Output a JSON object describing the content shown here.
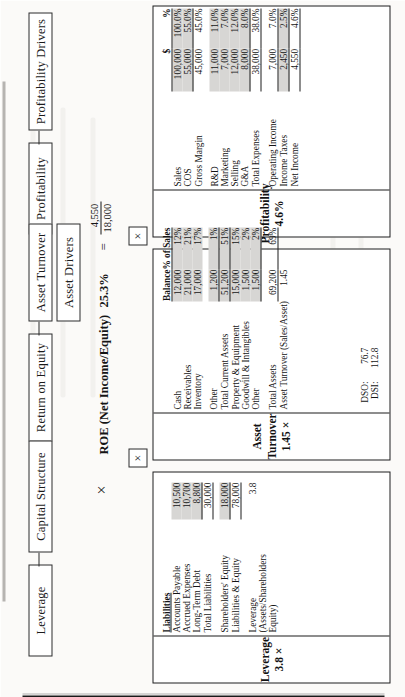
{
  "diagram": {
    "branches": [
      {
        "id": "profitability",
        "parent_label": "Profitability",
        "child_label": "Profitability Drivers"
      },
      {
        "id": "asset-turnover",
        "parent_label": "Return on Equity",
        "middle_label": "Asset Turnover",
        "child_label": "Asset Drivers"
      },
      {
        "id": "leverage",
        "parent_label": "Leverage",
        "child_label": "Capital Structure"
      }
    ],
    "operator": "×",
    "box_operator": "×"
  },
  "roe": {
    "label": "ROE (Net Income/Equity)",
    "value": "25.3%",
    "equals": "=",
    "numerator": "4,550",
    "denominator": "18,000"
  },
  "profitability_table": {
    "title": "Profitability",
    "subtitle": "4.6%",
    "columns": [
      "",
      "$",
      "%"
    ],
    "rows": [
      {
        "label": "Sales",
        "dollars": "100,000",
        "percent": "100.0%",
        "shade": true,
        "rule": "none",
        "indent": false
      },
      {
        "label": "COS",
        "dollars": "55,000",
        "percent": "55.0%",
        "shade": true,
        "rule": "bottom",
        "indent": false
      },
      {
        "label": "Gross Margin",
        "dollars": "45,000",
        "percent": "45.0%",
        "shade": false,
        "rule": "none",
        "indent": true
      },
      {
        "label": "R&D",
        "dollars": "11,000",
        "percent": "11.0%",
        "shade": true,
        "rule": "none",
        "indent": false
      },
      {
        "label": "Marketing",
        "dollars": "7,000",
        "percent": "7.0%",
        "shade": true,
        "rule": "none",
        "indent": false
      },
      {
        "label": "Selling",
        "dollars": "12,000",
        "percent": "12.0%",
        "shade": true,
        "rule": "none",
        "indent": false
      },
      {
        "label": "G&A",
        "dollars": "8,000",
        "percent": "8.0%",
        "shade": true,
        "rule": "bottom",
        "indent": false
      },
      {
        "label": "Total Expenses",
        "dollars": "38,000",
        "percent": "38.0%",
        "shade": false,
        "rule": "bottom",
        "indent": true
      },
      {
        "label": "Operating Income",
        "dollars": "7,000",
        "percent": "7.0%",
        "shade": false,
        "rule": "bottom",
        "indent": true
      },
      {
        "label": "Income Taxes",
        "dollars": "2,450",
        "percent": "2.5%",
        "shade": true,
        "rule": "bottom",
        "indent": false
      },
      {
        "label": "Net Income",
        "dollars": "4,550",
        "percent": "4.6%",
        "shade": false,
        "rule": "bottom",
        "indent": true
      }
    ]
  },
  "asset_table": {
    "title": "Asset Turnover",
    "subtitle": "1.45 ×",
    "columns": [
      "",
      "Balance",
      "% of Sales"
    ],
    "rows": [
      {
        "label": "Cash",
        "balance": "12,000",
        "pct": "12%",
        "shade": true,
        "rule": "none",
        "indent": false
      },
      {
        "label": "Receivables",
        "balance": "21,000",
        "pct": "21%",
        "shade": true,
        "rule": "none",
        "indent": false
      },
      {
        "label": "Inventory",
        "balance": "17,000",
        "pct": "17%",
        "shade": true,
        "rule": "none",
        "indent": false
      },
      {
        "label": "Other",
        "balance": "1,200",
        "pct": "1%",
        "shade": true,
        "rule": "bottom",
        "indent": false
      },
      {
        "label": "Total Current Assets",
        "balance": "51,200",
        "pct": "51%",
        "shade": true,
        "rule": "bottom",
        "indent": true
      },
      {
        "label": "Property & Equipment",
        "balance": "15,000",
        "pct": "15%",
        "shade": true,
        "rule": "none",
        "indent": false
      },
      {
        "label": "Goodwill & Intangibles",
        "balance": "1,500",
        "pct": "2%",
        "shade": true,
        "rule": "none",
        "indent": false
      },
      {
        "label": "Other",
        "balance": "1,500",
        "pct": "2%",
        "shade": true,
        "rule": "bottom",
        "indent": false
      },
      {
        "label": "Total Assets",
        "balance": "69,200",
        "pct": "69%",
        "shade": false,
        "rule": "bottom",
        "indent": true
      },
      {
        "label": "Asset Turnover (Sales/Asset)",
        "balance": "1.45",
        "pct": "",
        "shade": false,
        "rule": "none",
        "indent": false
      }
    ],
    "memo": [
      {
        "label": "DSO:",
        "value": "76.7"
      },
      {
        "label": "DSI:",
        "value": "112.8"
      }
    ]
  },
  "leverage_table": {
    "title": "Leverage",
    "subtitle": "3.8 ×",
    "section_header": "Liabilities",
    "rows": [
      {
        "label": "Accounts Payable",
        "value": "10,500",
        "shade": true,
        "rule": "none",
        "indent": false
      },
      {
        "label": "Accrued Expenses",
        "value": "10,700",
        "shade": true,
        "rule": "none",
        "indent": false
      },
      {
        "label": "Long-Term Debt",
        "value": "8,800",
        "shade": true,
        "rule": "bottom",
        "indent": false
      },
      {
        "label": "Total Liabilities",
        "value": "30,000",
        "shade": false,
        "rule": "bottom",
        "indent": true
      },
      {
        "label": "Shareholders' Equity",
        "value": "18,000",
        "shade": true,
        "rule": "bottom",
        "indent": false
      },
      {
        "label": "Liabilities & Equity",
        "value": "78,000",
        "shade": false,
        "rule": "bottom",
        "indent": false
      }
    ],
    "ratio_label_line1": "Leverage",
    "ratio_label_line2": "(Assets/Shareholders",
    "ratio_label_line3": "Equity)",
    "ratio_value": "3.8"
  }
}
